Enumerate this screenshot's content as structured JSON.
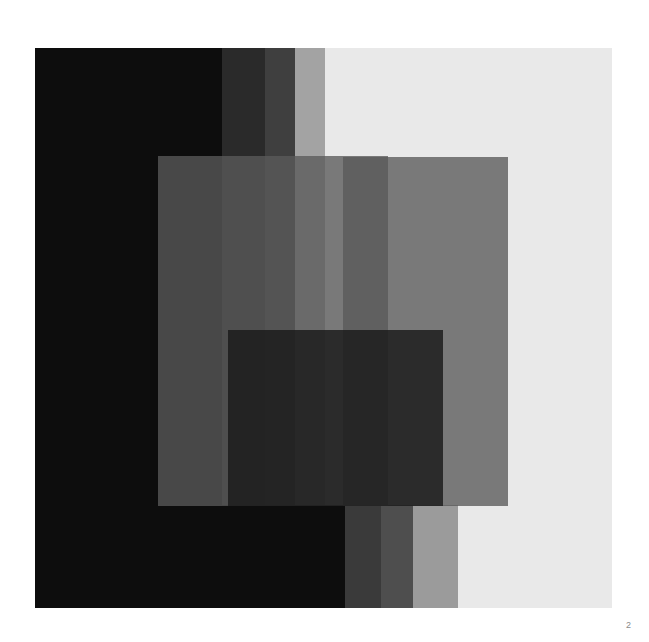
{
  "page": {
    "background": "#ffffff",
    "folio": "2",
    "folio_color": "#8a8a8a"
  },
  "artwork": {
    "title": "",
    "plate_rect": {
      "x": 35,
      "y": 48,
      "width": 577,
      "height": 560
    },
    "base_color": "#111111",
    "bands": [
      {
        "name": "band-black",
        "x": 0,
        "width": 187,
        "color": "#0d0d0d"
      },
      {
        "name": "band-very-dark",
        "x": 187,
        "width": 43,
        "color": "#2a2a2a"
      },
      {
        "name": "band-dark",
        "x": 230,
        "width": 30,
        "color": "#3f3f3f"
      },
      {
        "name": "band-mid",
        "x": 260,
        "width": 30,
        "color": "#a3a3a3"
      },
      {
        "name": "band-light",
        "x": 290,
        "width": 287,
        "color": "#e9e9e9"
      }
    ],
    "overlays": [
      {
        "name": "overlay-left-large",
        "x": 123,
        "y": 108,
        "width": 230,
        "height": 350,
        "color": "#5a5a5a",
        "opacity": 0.78
      },
      {
        "name": "overlay-right-large",
        "x": 308,
        "y": 109,
        "width": 165,
        "height": 349,
        "color": "#5a5a5a",
        "opacity": 0.78
      },
      {
        "name": "overlay-inner-dark",
        "x": 193,
        "y": 282,
        "width": 215,
        "height": 176,
        "color": "#1a1a1a",
        "opacity": 0.82
      }
    ],
    "footer_bands": [
      {
        "name": "footband-black",
        "x": 0,
        "width": 310,
        "y": 457,
        "height": 103,
        "color": "#0d0d0d"
      },
      {
        "name": "footband-dark",
        "x": 310,
        "width": 36,
        "y": 457,
        "height": 103,
        "color": "#3a3a3a"
      },
      {
        "name": "footband-mid-dark",
        "x": 346,
        "width": 32,
        "y": 457,
        "height": 103,
        "color": "#4e4e4e"
      },
      {
        "name": "footband-mid-gray",
        "x": 378,
        "width": 45,
        "y": 457,
        "height": 103,
        "color": "#9b9b9b"
      },
      {
        "name": "footband-light",
        "x": 423,
        "width": 154,
        "y": 457,
        "height": 103,
        "color": "#e9e9e9"
      }
    ]
  }
}
